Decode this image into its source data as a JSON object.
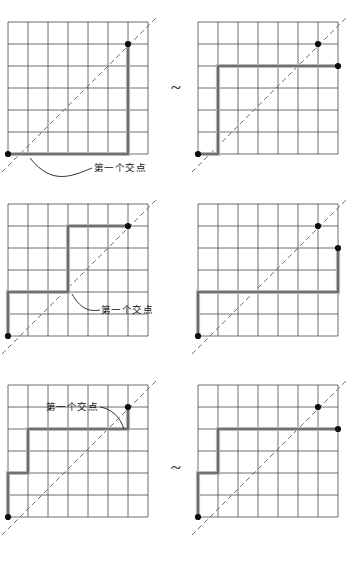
{
  "figure": {
    "rows": [
      {
        "id": "row-1",
        "separator": "~",
        "left": {
          "id": "panel-1-left",
          "annotation": "第一个交点",
          "annotation_position": "below-left",
          "grid": {
            "cols": 7,
            "rows": 6
          },
          "path_points": "(0,0) (5,0) (5,5)",
          "dots": [
            "(0,0)",
            "(5,5)"
          ],
          "diagonal": "y = x"
        },
        "right": {
          "id": "panel-1-right",
          "annotation": "",
          "grid": {
            "cols": 7,
            "rows": 6
          },
          "path_points": "(0,0) (1,0) (1,4) (7,4)",
          "dots": [
            "(0,0)",
            "(5,5)",
            "(7,4)"
          ],
          "diagonal": "y = x"
        }
      },
      {
        "id": "row-2",
        "separator": "~",
        "left": {
          "id": "panel-2-left",
          "annotation": "第一个交点",
          "annotation_position": "right",
          "grid": {
            "cols": 7,
            "rows": 6
          },
          "path_points": "(0,1) (0,2) (3,2) (3,5) (5,5)",
          "dots": [
            "(0,1)",
            "(5,5)"
          ],
          "diagonal": "y = x"
        },
        "right": {
          "id": "panel-2-right",
          "annotation": "",
          "grid": {
            "cols": 7,
            "rows": 6
          },
          "path_points": "(0,1) (0,2) (6,2) (6,4)",
          "dots": [
            "(0,1)",
            "(5,5)",
            "(6,4)"
          ],
          "diagonal": "y = x"
        }
      },
      {
        "id": "row-3",
        "separator": "~",
        "left": {
          "id": "panel-3-left",
          "annotation": "第一个交点",
          "annotation_position": "above-left",
          "grid": {
            "cols": 7,
            "rows": 6
          },
          "path_points": "(0,1) (1,1) (1,4) (5,4) (5,5)",
          "dots": [
            "(0,1)",
            "(5,5)"
          ],
          "diagonal": "y = x"
        },
        "right": {
          "id": "panel-3-right",
          "annotation": "",
          "grid": {
            "cols": 7,
            "rows": 6
          },
          "path_points": "(0,1) (1,1) (1,4) (7,4)",
          "dots": [
            "(0,1)",
            "(5,5)",
            "(7,4)"
          ],
          "diagonal": "y = x"
        }
      }
    ],
    "colors": {
      "grid_line": "#4a4a4a",
      "path_line": "#5c5c5c",
      "path_highlight": "#b0b0b0",
      "dot": "#0d0d0d",
      "diagonal": "#6b6b6b",
      "annotation_text": "#111111",
      "background": "#ffffff"
    }
  }
}
